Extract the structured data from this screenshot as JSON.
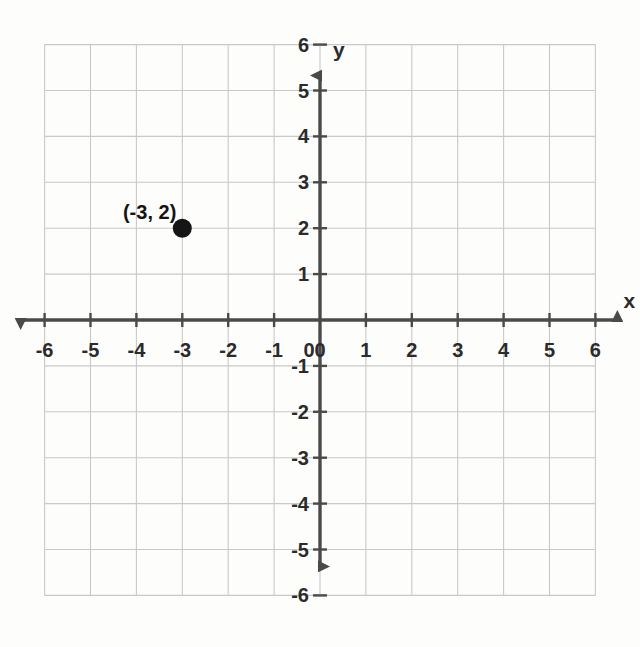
{
  "chart_data": {
    "type": "scatter",
    "title": "",
    "xlabel": "x",
    "ylabel": "y",
    "xlim": [
      -6,
      6
    ],
    "ylim": [
      -6,
      6
    ],
    "grid": true,
    "grid_step": 1,
    "legend": "none",
    "x_tick_labels": [
      "-6",
      "-5",
      "-4",
      "-3",
      "-2",
      "-1",
      "0",
      "1",
      "2",
      "3",
      "4",
      "5",
      "6"
    ],
    "y_tick_labels": [
      "6",
      "5",
      "4",
      "3",
      "2",
      "1",
      "-1",
      "-2",
      "-3",
      "-4",
      "-5",
      "-6"
    ],
    "x_ticks": [
      -6,
      -5,
      -4,
      -3,
      -2,
      -1,
      0,
      1,
      2,
      3,
      4,
      5,
      6
    ],
    "y_ticks": [
      6,
      5,
      4,
      3,
      2,
      1,
      -1,
      -2,
      -3,
      -4,
      -5,
      -6
    ],
    "origin_label": "0",
    "points": [
      {
        "x": -3,
        "y": 2,
        "label": "(-3, 2)"
      }
    ],
    "series": [
      {
        "name": "plotted point",
        "x": [
          -3
        ],
        "y": [
          2
        ]
      }
    ],
    "colors": {
      "grid": "#c9c9c9",
      "axis": "#4a4a4a",
      "point": "#151515",
      "text": "#2b2b2b",
      "background": "#fdfdfc"
    }
  },
  "axes": {
    "x_axis_label": "x",
    "y_axis_label": "y"
  }
}
